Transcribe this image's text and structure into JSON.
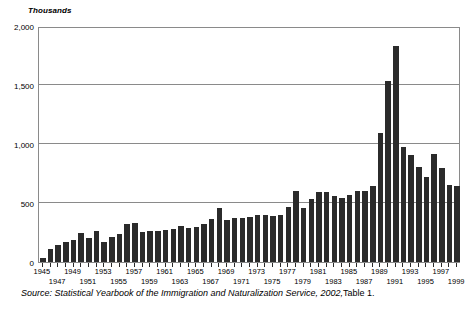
{
  "chart_data": {
    "type": "bar",
    "title": "",
    "subtitle": "",
    "unit_label": "Thousands",
    "xlabel": "",
    "ylabel": "Thousands",
    "ylim": [
      0,
      2000
    ],
    "y_ticks": [
      0,
      500,
      1000,
      1500,
      2000
    ],
    "y_tick_labels": [
      "0",
      "500",
      "1,000",
      "1,500",
      "2,000"
    ],
    "grid": "horizontal",
    "legend": "none",
    "bar_color": "#2b2b2b",
    "categories": [
      "1945",
      "1946",
      "1947",
      "1948",
      "1949",
      "1950",
      "1951",
      "1952",
      "1953",
      "1954",
      "1955",
      "1956",
      "1957",
      "1958",
      "1959",
      "1960",
      "1961",
      "1962",
      "1963",
      "1964",
      "1965",
      "1966",
      "1967",
      "1968",
      "1969",
      "1970",
      "1971",
      "1972",
      "1973",
      "1974",
      "1975",
      "1976",
      "1977",
      "1978",
      "1979",
      "1980",
      "1981",
      "1982",
      "1983",
      "1984",
      "1985",
      "1986",
      "1987",
      "1988",
      "1989",
      "1990",
      "1991",
      "1992",
      "1993",
      "1994",
      "1995",
      "1996",
      "1997",
      "1998",
      "1999"
    ],
    "x_tick_labels_top": [
      "1945",
      "1949",
      "1953",
      "1957",
      "1961",
      "1965",
      "1969",
      "1973",
      "1977",
      "1981",
      "1985",
      "1989",
      "1993",
      "1997"
    ],
    "x_tick_labels_bottom": [
      "1947",
      "1951",
      "1955",
      "1959",
      "1963",
      "1967",
      "1971",
      "1975",
      "1979",
      "1983",
      "1987",
      "1991",
      "1995",
      "1999"
    ],
    "values": [
      38,
      108,
      147,
      170,
      188,
      249,
      206,
      266,
      170,
      208,
      238,
      322,
      327,
      253,
      261,
      265,
      271,
      284,
      306,
      292,
      297,
      323,
      362,
      454,
      359,
      373,
      370,
      385,
      400,
      395,
      386,
      399,
      462,
      601,
      460,
      531,
      597,
      594,
      560,
      544,
      570,
      602,
      602,
      643,
      1091,
      1536,
      1827,
      974,
      904,
      804,
      720,
      916,
      798,
      654,
      647
    ],
    "annotations": [],
    "source_note_italic": "Source: Statistical Yearbook of the Immigration and Naturalization Service, 2002,",
    "source_note_plain": "Table 1."
  }
}
